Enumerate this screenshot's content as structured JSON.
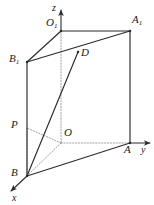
{
  "figure": {
    "stroke_color": "#2b2b2b",
    "dashed_color": "#8c8c8c",
    "background": "#ffffff",
    "width": 154,
    "height": 205
  },
  "axes": [
    {
      "name": "x-axis",
      "label": "x",
      "label_x": 12,
      "label_y": 192,
      "from": [
        27,
        176
      ],
      "to": [
        11,
        191
      ]
    },
    {
      "name": "y-axis",
      "label": "y",
      "label_x": 141,
      "label_y": 144,
      "from": [
        130,
        143
      ],
      "to": [
        150,
        143
      ]
    },
    {
      "name": "z-axis",
      "label": "z",
      "label_x": 52,
      "label_y": 2,
      "from": [
        61,
        31
      ],
      "to": [
        61,
        10
      ]
    }
  ],
  "points": [
    {
      "name": "O",
      "label": "O",
      "sub": "",
      "x": 61,
      "y": 143,
      "label_x": 64,
      "label_y": 127
    },
    {
      "name": "O1",
      "label": "O",
      "sub": "1",
      "x": 61,
      "y": 31,
      "label_x": 46,
      "label_y": 17
    },
    {
      "name": "A",
      "label": "A",
      "sub": "",
      "x": 130,
      "y": 143,
      "label_x": 124,
      "label_y": 144
    },
    {
      "name": "A1",
      "label": "A",
      "sub": "1",
      "x": 130,
      "y": 31,
      "label_x": 132,
      "label_y": 14
    },
    {
      "name": "B",
      "label": "B",
      "sub": "",
      "x": 27,
      "y": 176,
      "label_x": 11,
      "label_y": 167
    },
    {
      "name": "B1",
      "label": "B",
      "sub": "1",
      "x": 27,
      "y": 62,
      "label_x": 9,
      "label_y": 53
    },
    {
      "name": "P",
      "label": "P",
      "sub": "",
      "x": 27,
      "y": 128,
      "label_x": 11,
      "label_y": 119
    },
    {
      "name": "D",
      "label": "D",
      "sub": "",
      "x": 78,
      "y": 52,
      "label_x": 81,
      "label_y": 47
    }
  ],
  "solid_edges": [
    {
      "name": "edge-B-A",
      "from": [
        27,
        176
      ],
      "to": [
        130,
        143
      ]
    },
    {
      "name": "edge-B-B1",
      "from": [
        27,
        176
      ],
      "to": [
        27,
        62
      ]
    },
    {
      "name": "edge-A-A1",
      "from": [
        130,
        143
      ],
      "to": [
        130,
        31
      ]
    },
    {
      "name": "edge-B1-A1",
      "from": [
        27,
        62
      ],
      "to": [
        130,
        31
      ]
    },
    {
      "name": "edge-B1-O1",
      "from": [
        27,
        62
      ],
      "to": [
        61,
        31
      ]
    },
    {
      "name": "edge-O1-A1",
      "from": [
        61,
        31
      ],
      "to": [
        130,
        31
      ]
    },
    {
      "name": "segment-B-D",
      "from": [
        27,
        176
      ],
      "to": [
        78,
        52
      ]
    }
  ],
  "dashed_edges": [
    {
      "name": "dashed-O-A",
      "from": [
        61,
        143
      ],
      "to": [
        130,
        143
      ]
    },
    {
      "name": "dashed-O-B",
      "from": [
        61,
        143
      ],
      "to": [
        27,
        176
      ]
    },
    {
      "name": "dashed-O-P",
      "from": [
        61,
        143
      ],
      "to": [
        27,
        128
      ]
    },
    {
      "name": "dashed-P-B",
      "from": [
        27,
        128
      ],
      "to": [
        27,
        176
      ]
    },
    {
      "name": "dashed-z-axis",
      "from": [
        61,
        31
      ],
      "to": [
        61,
        143
      ]
    }
  ]
}
